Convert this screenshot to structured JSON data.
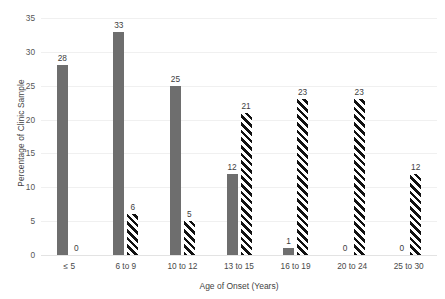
{
  "chart_data": {
    "type": "bar",
    "title": "",
    "xlabel": "Age of Onset (Years)",
    "ylabel": "Percentage of Clinic Sample",
    "categories": [
      "≤ 5",
      "6 to 9",
      "10 to 12",
      "13 to 15",
      "16 to 19",
      "20 to 24",
      "25 to 30"
    ],
    "series": [
      {
        "name": "series-solid",
        "style": "solid-gray",
        "color": "#6e6e6e",
        "values": [
          28,
          33,
          25,
          12,
          1,
          0,
          0
        ]
      },
      {
        "name": "series-hatched",
        "style": "diagonal-hatch",
        "color": "#111111",
        "values": [
          0,
          6,
          5,
          21,
          23,
          23,
          12
        ]
      }
    ],
    "ylim": [
      0,
      35
    ],
    "yticks": [
      0,
      5,
      10,
      15,
      20,
      25,
      30,
      35
    ],
    "ytick_labels": [
      "0",
      "5",
      "10",
      "15",
      "20",
      "25",
      "30",
      "35"
    ],
    "grid": true,
    "legend": "none",
    "data_labels": true
  }
}
